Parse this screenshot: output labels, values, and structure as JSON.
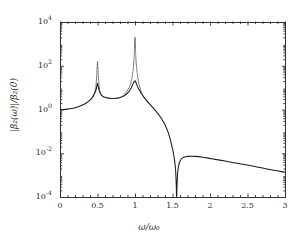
{
  "chart_data": {
    "type": "line",
    "title": "",
    "xlabel": "ω/ω₀",
    "ylabel": "|β₂(ω)|/β₂(0)",
    "yscale": "log",
    "xscale": "linear",
    "xlim": [
      0,
      3
    ],
    "ylim": [
      0.0001,
      10000
    ],
    "grid": false,
    "legend": "none",
    "xticks": [
      0,
      0.5,
      1,
      1.5,
      2,
      2.5,
      3
    ],
    "xtick_labels": [
      "0",
      "0.5",
      "1",
      "1.5",
      "2",
      "2.5",
      "3"
    ],
    "yticks": [
      0.0001,
      0.01,
      1,
      100,
      10000
    ],
    "ytick_labels": [
      "10⁻⁴",
      "10⁻²",
      "10⁰",
      "10²",
      "10⁴"
    ],
    "ytick_mantissa": [
      "10",
      "10",
      "10",
      "10",
      "10"
    ],
    "ytick_exponent": [
      "-4",
      "-2",
      "0",
      "2",
      "4"
    ],
    "series": [
      {
        "name": "damped",
        "style": "solid",
        "color": "#1a1a1a",
        "x": [
          0.0,
          0.05,
          0.1,
          0.15,
          0.2,
          0.25,
          0.3,
          0.35,
          0.4,
          0.43,
          0.46,
          0.48,
          0.49,
          0.495,
          0.5,
          0.505,
          0.51,
          0.52,
          0.54,
          0.57,
          0.6,
          0.65,
          0.7,
          0.75,
          0.8,
          0.85,
          0.9,
          0.94,
          0.97,
          0.99,
          0.995,
          1.0,
          1.005,
          1.01,
          1.03,
          1.06,
          1.1,
          1.15,
          1.2,
          1.25,
          1.3,
          1.35,
          1.4,
          1.45,
          1.5,
          1.52,
          1.54,
          1.55,
          1.555,
          1.56,
          1.57,
          1.59,
          1.62,
          1.66,
          1.7,
          1.75,
          1.8,
          1.9,
          2.0,
          2.2,
          2.4,
          2.6,
          2.8,
          3.0
        ],
        "y": [
          1.0,
          1.01,
          1.04,
          1.1,
          1.2,
          1.36,
          1.6,
          1.98,
          2.7,
          3.5,
          5.2,
          8.0,
          11.0,
          14.0,
          16.0,
          14.0,
          11.0,
          8.0,
          5.2,
          4.0,
          3.6,
          3.3,
          3.2,
          3.25,
          3.5,
          4.1,
          5.6,
          8.5,
          14.0,
          19.0,
          20.0,
          20.5,
          20.0,
          18.0,
          12.0,
          7.5,
          4.5,
          2.7,
          1.7,
          1.1,
          0.68,
          0.4,
          0.2,
          0.075,
          0.016,
          0.007,
          0.002,
          0.00035,
          8e-05,
          0.0003,
          0.0014,
          0.0035,
          0.0056,
          0.0068,
          0.0072,
          0.0073,
          0.0072,
          0.0066,
          0.0058,
          0.0044,
          0.0033,
          0.0025,
          0.0018,
          0.00135
        ]
      },
      {
        "name": "undamped",
        "style": "dotted",
        "color": "#333333",
        "x": [
          0.4,
          0.44,
          0.47,
          0.485,
          0.49,
          0.495,
          0.498,
          0.5,
          0.502,
          0.505,
          0.51,
          0.515,
          0.53,
          0.56,
          0.6,
          0.7,
          0.8,
          0.88,
          0.93,
          0.96,
          0.98,
          0.99,
          0.995,
          0.998,
          1.0,
          1.002,
          1.005,
          1.01,
          1.02,
          1.04,
          1.07,
          1.12,
          1.2
        ],
        "y": [
          2.7,
          4.2,
          8.0,
          20.0,
          40.0,
          90.0,
          130.0,
          150.0,
          130.0,
          90.0,
          40.0,
          22.0,
          7.0,
          4.2,
          3.6,
          3.2,
          3.5,
          6.0,
          12.0,
          30.0,
          90.0,
          300.0,
          900.0,
          1600.0,
          2000.0,
          1600.0,
          900.0,
          300.0,
          90.0,
          25.0,
          9.0,
          3.5,
          1.7
        ]
      }
    ],
    "annotations": []
  },
  "figure": {
    "background_color": "#ffffff",
    "frame_color": "#333333",
    "plot_left": 60,
    "plot_top": 22,
    "plot_right": 285,
    "plot_bottom": 197
  }
}
